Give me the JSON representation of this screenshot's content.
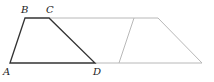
{
  "diagram": {
    "type": "geometry",
    "points": {
      "A": {
        "label": "A",
        "x": 10,
        "y": 63
      },
      "B": {
        "label": "B",
        "x": 25,
        "y": 18
      },
      "C": {
        "label": "C",
        "x": 49,
        "y": 18
      },
      "D": {
        "label": "D",
        "x": 95,
        "y": 63
      }
    },
    "colors": {
      "primary_stroke": "#333333",
      "secondary_stroke": "#b8b8b8"
    }
  }
}
